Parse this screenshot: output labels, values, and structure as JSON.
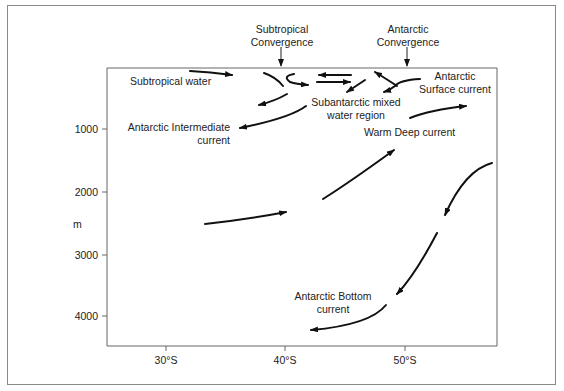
{
  "diagram": {
    "y_axis": {
      "unit_label": "m",
      "ticks": [
        "1000",
        "2000",
        "3000",
        "4000"
      ]
    },
    "x_axis": {
      "ticks": [
        "30°S",
        "40°S",
        "50°S"
      ]
    },
    "convergences": [
      {
        "line1": "Subtropical",
        "line2": "Convergence"
      },
      {
        "line1": "Antarctic",
        "line2": "Convergence"
      }
    ],
    "labels": {
      "subtropical_water": "Subtropical  water",
      "antarctic_intermediate_1": "Antarctic  Intermediate",
      "antarctic_intermediate_2": "current",
      "subantarctic_1": "Subantarctic mixed",
      "subantarctic_2": "water region",
      "antarctic_surface_1": "Antarctic",
      "antarctic_surface_2": "Surface current",
      "warm_deep": "Warm Deep current",
      "antarctic_bottom_1": "Antarctic Bottom",
      "antarctic_bottom_2": "current"
    },
    "colors": {
      "line": "#111111",
      "axis": "#555555",
      "frame": "#8a8a8a"
    }
  }
}
